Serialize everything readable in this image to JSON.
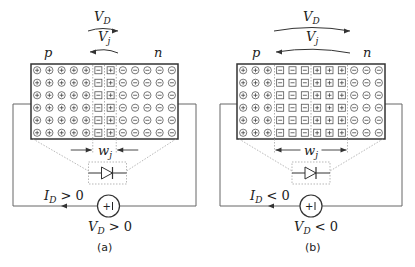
{
  "panels": [
    {
      "id": "a",
      "caption": "(a)",
      "p_label": "p",
      "n_label": "n",
      "vd_label": "V",
      "vd_sub": "D",
      "vj_label": "V",
      "vj_sub": "j",
      "wj_label": "w",
      "wj_sub": "j",
      "current_label": "I",
      "current_sub": "D",
      "current_rel": " > 0",
      "source_label": "V",
      "source_sub": "D",
      "source_rel": " > 0",
      "columns": [
        "+",
        "+",
        "+",
        "+",
        "+",
        "-box",
        "+box",
        "-",
        "-",
        "-",
        "-",
        "-"
      ],
      "rows": 6,
      "bias": "forward"
    },
    {
      "id": "b",
      "caption": "(b)",
      "p_label": "p",
      "n_label": "n",
      "vd_label": "V",
      "vd_sub": "D",
      "vj_label": "V",
      "vj_sub": "j",
      "wj_label": "w",
      "wj_sub": "j",
      "current_label": "I",
      "current_sub": "D",
      "current_rel": " < 0",
      "source_label": "V",
      "source_sub": "D",
      "source_rel": " < 0",
      "columns": [
        "+",
        "+",
        "+",
        "-box",
        "-box",
        "-box",
        "+box",
        "+box",
        "+box",
        "-",
        "-",
        "-"
      ],
      "rows": 6,
      "bias": "reverse"
    }
  ],
  "source_symbol": "+ |",
  "colors": {
    "line": "#333333",
    "dotted": "#999999",
    "text": "#222222"
  }
}
